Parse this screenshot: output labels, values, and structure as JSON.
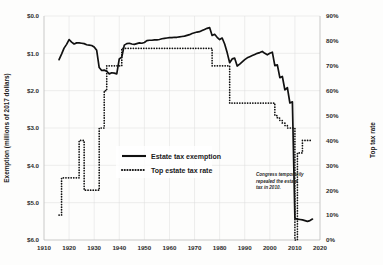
{
  "chart_data": {
    "type": "line",
    "title": "",
    "xlabel": "",
    "ylabel": "Exemption (millions of 2017 dollars)",
    "y2label": "Top tax rate",
    "xlim": [
      1910,
      2020
    ],
    "ylim": [
      6.0,
      0.0
    ],
    "y2lim": [
      0,
      90
    ],
    "y_inverted": true,
    "grid": true,
    "legend_position": "center-left",
    "x_ticks": [
      "1910",
      "1920",
      "1930",
      "1940",
      "1950",
      "1960",
      "1970",
      "1980",
      "1990",
      "2000",
      "2010",
      "2020"
    ],
    "x_tick_values": [
      1910,
      1920,
      1930,
      1940,
      1950,
      1960,
      1970,
      1980,
      1990,
      2000,
      2010,
      2020
    ],
    "y_ticks": [
      "$0.0",
      "$1.0",
      "$2.0",
      "$3.0",
      "$4.0",
      "$5.0",
      "$6.0"
    ],
    "y_tick_values": [
      0.0,
      1.0,
      2.0,
      3.0,
      4.0,
      5.0,
      6.0
    ],
    "y2_ticks": [
      "90%",
      "80%",
      "70%",
      "60%",
      "50%",
      "40%",
      "30%",
      "20%",
      "10%",
      "0%"
    ],
    "y2_tick_values": [
      90,
      80,
      70,
      60,
      50,
      40,
      30,
      20,
      10,
      0
    ],
    "annotations": [
      {
        "text": "Congress temporarily repealed the estate tax in 2010.",
        "x": 2004,
        "y_rate": 22
      }
    ],
    "series": [
      {
        "name": "Estate tax exemption",
        "label": "Estate tax exemption",
        "style": "solid",
        "axis": "left",
        "units": "millions of 2017 dollars",
        "x": [
          1916,
          1917,
          1918,
          1919,
          1920,
          1921,
          1922,
          1923,
          1924,
          1925,
          1926,
          1927,
          1928,
          1929,
          1930,
          1931,
          1932,
          1933,
          1934,
          1935,
          1936,
          1937,
          1938,
          1939,
          1940,
          1941,
          1942,
          1943,
          1944,
          1945,
          1946,
          1947,
          1948,
          1949,
          1950,
          1951,
          1952,
          1953,
          1954,
          1955,
          1956,
          1957,
          1958,
          1959,
          1960,
          1961,
          1962,
          1963,
          1964,
          1965,
          1966,
          1967,
          1968,
          1969,
          1970,
          1971,
          1972,
          1973,
          1974,
          1975,
          1976,
          1977,
          1978,
          1979,
          1980,
          1981,
          1982,
          1983,
          1984,
          1985,
          1986,
          1987,
          1988,
          1989,
          1990,
          1991,
          1992,
          1993,
          1994,
          1995,
          1996,
          1997,
          1998,
          1999,
          2000,
          2001,
          2002,
          2003,
          2004,
          2005,
          2006,
          2007,
          2008,
          2009,
          2010,
          2011,
          2012,
          2013,
          2014,
          2015,
          2016,
          2017
        ],
        "values": [
          1.17,
          1.02,
          0.86,
          0.76,
          0.63,
          0.7,
          0.75,
          0.72,
          0.72,
          0.73,
          0.74,
          0.77,
          0.78,
          0.79,
          0.83,
          0.92,
          1.38,
          1.46,
          1.45,
          1.48,
          1.55,
          1.52,
          1.53,
          1.55,
          1.15,
          1.1,
          0.78,
          0.74,
          0.73,
          0.75,
          0.76,
          0.74,
          0.72,
          0.73,
          0.71,
          0.66,
          0.65,
          0.65,
          0.64,
          0.64,
          0.63,
          0.61,
          0.6,
          0.59,
          0.58,
          0.58,
          0.57,
          0.57,
          0.56,
          0.55,
          0.54,
          0.52,
          0.5,
          0.47,
          0.45,
          0.43,
          0.42,
          0.39,
          0.36,
          0.33,
          0.31,
          0.52,
          0.49,
          0.57,
          0.63,
          0.59,
          0.75,
          0.98,
          1.25,
          1.15,
          1.13,
          1.34,
          1.29,
          1.23,
          1.17,
          1.12,
          1.09,
          1.06,
          1.03,
          1.0,
          0.98,
          0.95,
          1.0,
          1.04,
          1.0,
          0.97,
          1.33,
          1.31,
          1.65,
          1.62,
          1.98,
          1.92,
          2.33,
          2.3,
          5.42,
          5.44,
          5.45,
          5.46,
          5.48,
          5.5,
          5.48,
          5.44
        ]
      },
      {
        "name": "Top estate tax rate",
        "label": "Top estate tax rate",
        "style": "dotted",
        "axis": "right",
        "units": "percent",
        "x": [
          1916,
          1917,
          1918,
          1919,
          1920,
          1921,
          1922,
          1923,
          1924,
          1925,
          1926,
          1927,
          1928,
          1929,
          1930,
          1931,
          1932,
          1933,
          1934,
          1935,
          1936,
          1937,
          1938,
          1939,
          1940,
          1941,
          1942,
          1943,
          1944,
          1945,
          1946,
          1947,
          1948,
          1949,
          1950,
          1951,
          1952,
          1953,
          1954,
          1955,
          1956,
          1957,
          1958,
          1959,
          1960,
          1961,
          1962,
          1963,
          1964,
          1965,
          1966,
          1967,
          1968,
          1969,
          1970,
          1971,
          1972,
          1973,
          1974,
          1975,
          1976,
          1977,
          1978,
          1979,
          1980,
          1981,
          1982,
          1983,
          1984,
          1985,
          1986,
          1987,
          1988,
          1989,
          1990,
          1991,
          1992,
          1993,
          1994,
          1995,
          1996,
          1997,
          1998,
          1999,
          2000,
          2001,
          2002,
          2003,
          2004,
          2005,
          2006,
          2007,
          2008,
          2009,
          2010,
          2011,
          2012,
          2013,
          2014,
          2015,
          2016,
          2017
        ],
        "values": [
          10,
          25,
          25,
          25,
          25,
          25,
          25,
          25,
          40,
          40,
          20,
          20,
          20,
          20,
          20,
          20,
          45,
          45,
          60,
          70,
          70,
          70,
          70,
          70,
          70,
          77,
          77,
          77,
          77,
          77,
          77,
          77,
          77,
          77,
          77,
          77,
          77,
          77,
          77,
          77,
          77,
          77,
          77,
          77,
          77,
          77,
          77,
          77,
          77,
          77,
          77,
          77,
          77,
          77,
          77,
          77,
          77,
          77,
          77,
          77,
          77,
          70,
          70,
          70,
          70,
          70,
          70,
          70,
          55,
          55,
          55,
          55,
          55,
          55,
          55,
          55,
          55,
          55,
          55,
          55,
          55,
          55,
          55,
          55,
          55,
          55,
          50,
          49,
          48,
          47,
          46,
          45,
          45,
          45,
          0,
          35,
          35,
          40,
          40,
          40,
          40,
          40
        ]
      }
    ]
  },
  "legend": {
    "items": [
      {
        "label": "Estate tax exemption",
        "style": "solid"
      },
      {
        "label": "Top estate tax rate",
        "style": "dotted"
      }
    ]
  },
  "annotation": {
    "line1": "Congress temporarily",
    "line2": "repealed the estate",
    "line3": "tax in 2010."
  },
  "axes": {
    "left_title": "Exemption (millions of 2017 dollars)",
    "right_title": "Top tax rate"
  }
}
